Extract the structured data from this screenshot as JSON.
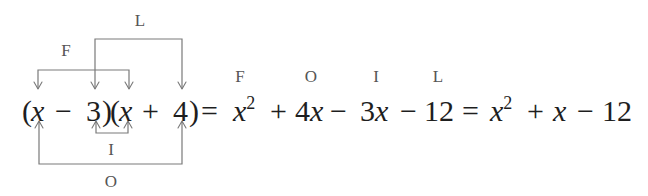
{
  "diagram": {
    "colors": {
      "text": "#1e1e1e",
      "label": "#555555",
      "bracket": "#7a7a7a",
      "background": "#ffffff"
    },
    "left_expression": {
      "tokens": [
        {
          "text": "(",
          "x": 22
        },
        {
          "text": "x",
          "x": 31,
          "italic": true
        },
        {
          "text": "−",
          "x": 55
        },
        {
          "text": "3",
          "x": 86
        },
        {
          "text": ")",
          "x": 102
        },
        {
          "text": "(",
          "x": 110
        },
        {
          "text": "x",
          "x": 119,
          "italic": true
        },
        {
          "text": "+",
          "x": 142
        },
        {
          "text": "4",
          "x": 173
        },
        {
          "text": ")",
          "x": 189
        }
      ]
    },
    "brackets": {
      "F": {
        "label": "F",
        "connects": [
          "x (first factor)",
          "x (second factor)"
        ],
        "position": "top-inner"
      },
      "O": {
        "label": "O",
        "connects": [
          "x (first factor)",
          "4"
        ],
        "position": "bottom-outer"
      },
      "I": {
        "label": "I",
        "connects": [
          "3",
          "x (second factor)"
        ],
        "position": "bottom-inner"
      },
      "L": {
        "label": "L",
        "connects": [
          "3",
          "4"
        ],
        "position": "top-outer"
      }
    },
    "expansion": {
      "equals_1": "=",
      "terms": [
        {
          "label": "F",
          "coef": "",
          "var": "x",
          "exp": "2"
        },
        {
          "op": "+"
        },
        {
          "label": "O",
          "coef": "4",
          "var": "x",
          "exp": ""
        },
        {
          "op": "−"
        },
        {
          "label": "I",
          "coef": "3",
          "var": "x",
          "exp": ""
        },
        {
          "op": "−"
        },
        {
          "label": "L",
          "coef": "12",
          "var": "",
          "exp": ""
        }
      ],
      "equals_2": "=",
      "simplified": [
        {
          "coef": "",
          "var": "x",
          "exp": "2"
        },
        {
          "op": "+"
        },
        {
          "coef": "",
          "var": "x",
          "exp": ""
        },
        {
          "op": "−"
        },
        {
          "coef": "12",
          "var": "",
          "exp": ""
        }
      ]
    },
    "text": {
      "paren_open": "(",
      "paren_close": ")",
      "x": "x",
      "minus": "−",
      "plus": "+",
      "equals": "=",
      "three": "3",
      "four": "4",
      "twelve": "12",
      "exp2": "2",
      "coef4": "4",
      "coef3": "3",
      "label_F": "F",
      "label_O": "O",
      "label_I": "I",
      "label_L": "L"
    }
  }
}
